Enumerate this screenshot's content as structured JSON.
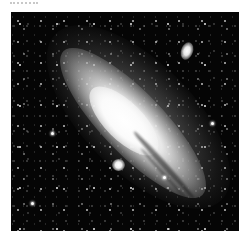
{
  "image": {
    "subject": "Andromeda Galaxy (M31) with satellite galaxies",
    "style": "grayscale astrophotograph",
    "alt": "Grayscale photograph of a large spiral galaxy tilted diagonally from upper-left to lower-right against a dense star field, with a small elliptical companion galaxy at upper right and a compact companion near the lower center",
    "features": {
      "main_galaxy": "m31-disk",
      "companion_upper_right": "m110",
      "companion_lower_center": "m32"
    },
    "colors": {
      "background": "#050505",
      "core": "#ffffff",
      "page": "#ffffff"
    }
  },
  "caption": {
    "text": ""
  }
}
